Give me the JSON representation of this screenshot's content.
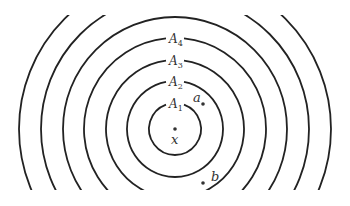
{
  "diagram": {
    "center": {
      "x": 175,
      "y": 129
    },
    "radii": [
      26,
      48,
      69,
      91,
      112,
      134,
      156
    ],
    "ring_labels": [
      {
        "text": "A",
        "sub": "1",
        "ring": 0
      },
      {
        "text": "A",
        "sub": "2",
        "ring": 1
      },
      {
        "text": "A",
        "sub": "3",
        "ring": 2
      },
      {
        "text": "A",
        "sub": "4",
        "ring": 3
      }
    ],
    "points": [
      {
        "label": "x",
        "x": 175,
        "y": 129
      },
      {
        "label": "a",
        "x": 203,
        "y": 104
      },
      {
        "label": "b",
        "x": 203,
        "y": 183
      }
    ],
    "stroke_color": "#222222"
  }
}
